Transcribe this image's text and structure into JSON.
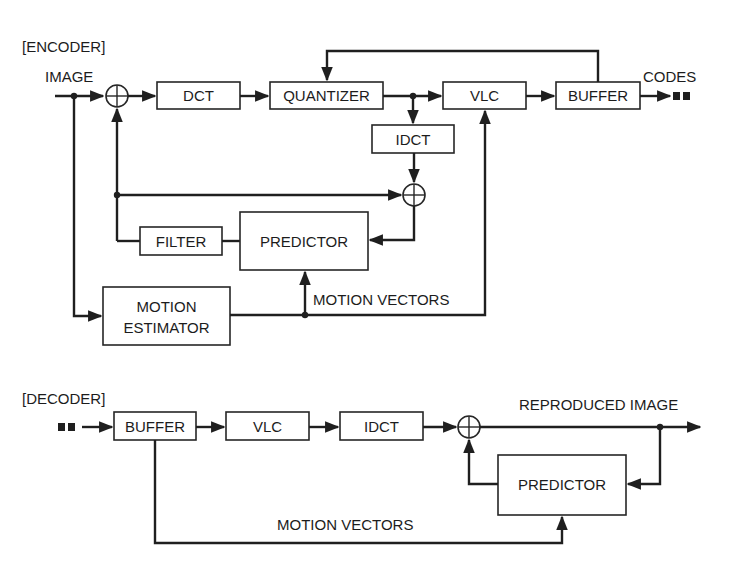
{
  "encoder": {
    "section_label": "[ENCODER]",
    "input_label": "IMAGE",
    "output_label": "CODES",
    "blocks": {
      "dct": "DCT",
      "quantizer": "QUANTIZER",
      "vlc": "VLC",
      "buffer": "BUFFER",
      "idct": "IDCT",
      "filter": "FILTER",
      "predictor": "PREDICTOR",
      "motion_estimator_line1": "MOTION",
      "motion_estimator_line2": "ESTIMATOR"
    },
    "signal_labels": {
      "motion_vectors": "MOTION VECTORS"
    }
  },
  "decoder": {
    "section_label": "[DECODER]",
    "output_label": "REPRODUCED IMAGE",
    "blocks": {
      "buffer": "BUFFER",
      "vlc": "VLC",
      "idct": "IDCT",
      "predictor": "PREDICTOR"
    },
    "signal_labels": {
      "motion_vectors": "MOTION VECTORS"
    }
  },
  "colors": {
    "line": "#1f1f1f",
    "background": "#ffffff"
  }
}
